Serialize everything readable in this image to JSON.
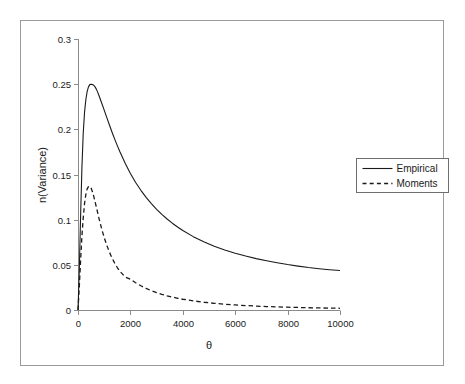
{
  "figure": {
    "border_color": "#9a9a9a",
    "background": "#ffffff",
    "plot_left_px": 78,
    "plot_right_px": 340,
    "plot_top_px": 39,
    "plot_bottom_px": 310
  },
  "chart_data": {
    "type": "line",
    "title": "",
    "subtitle": "",
    "xlabel": "θ",
    "ylabel": "n(Variance)",
    "xlim": [
      0,
      10000
    ],
    "ylim": [
      0,
      0.3
    ],
    "grid": false,
    "legend_position": "right",
    "x_ticks": [
      0,
      2000,
      4000,
      6000,
      8000,
      10000
    ],
    "x_tick_labels": [
      "0",
      "2000",
      "4000",
      "6000",
      "8000",
      "10000"
    ],
    "y_ticks": [
      0,
      0.05,
      0.1,
      0.15,
      0.2,
      0.25,
      0.3
    ],
    "y_tick_labels": [
      "0",
      "0.05",
      "0.1",
      "0.15",
      "0.2",
      "0.25",
      "0.3"
    ],
    "series": [
      {
        "name": "Empirical",
        "style": "solid",
        "color": "#1a1a1a",
        "width": 1.1,
        "x": [
          0,
          50,
          100,
          150,
          200,
          250,
          300,
          350,
          400,
          450,
          500,
          550,
          600,
          650,
          700,
          750,
          800,
          900,
          1000,
          1100,
          1200,
          1300,
          1400,
          1500,
          1600,
          1800,
          2000,
          2200,
          2400,
          2600,
          2800,
          3000,
          3200,
          3400,
          3600,
          3800,
          4000,
          4400,
          4800,
          5200,
          5600,
          6000,
          6400,
          6800,
          7200,
          7600,
          8000,
          8400,
          8800,
          9200,
          9600,
          10000
        ],
        "y": [
          0,
          0.045,
          0.105,
          0.158,
          0.196,
          0.219,
          0.233,
          0.242,
          0.247,
          0.2495,
          0.25,
          0.2497,
          0.2488,
          0.247,
          0.2445,
          0.2412,
          0.2375,
          0.2295,
          0.2212,
          0.213,
          0.2048,
          0.1968,
          0.1892,
          0.182,
          0.1752,
          0.1625,
          0.1512,
          0.1412,
          0.1325,
          0.1247,
          0.1178,
          0.1115,
          0.1058,
          0.1007,
          0.0961,
          0.0919,
          0.088,
          0.0812,
          0.0755,
          0.0706,
          0.0665,
          0.0629,
          0.0597,
          0.0569,
          0.0545,
          0.0523,
          0.0503,
          0.0486,
          0.047,
          0.0457,
          0.0446,
          0.0437
        ]
      },
      {
        "name": "Moments",
        "style": "dashed",
        "color": "#1a1a1a",
        "width": 1.3,
        "x": [
          0,
          50,
          100,
          150,
          200,
          250,
          300,
          350,
          400,
          450,
          500,
          550,
          600,
          700,
          800,
          900,
          1000,
          1100,
          1200,
          1300,
          1400,
          1500,
          1600,
          1800,
          2000,
          2200,
          2400,
          2600,
          2800,
          3000,
          3200,
          3400,
          3600,
          3800,
          4000,
          4400,
          4800,
          5200,
          5600,
          6000,
          6400,
          6800,
          7200,
          7600,
          8000,
          8400,
          8800,
          9200,
          9600,
          10000
        ],
        "y": [
          0,
          0.026,
          0.055,
          0.082,
          0.102,
          0.118,
          0.128,
          0.134,
          0.1365,
          0.137,
          0.135,
          0.131,
          0.126,
          0.114,
          0.1015,
          0.0902,
          0.0802,
          0.0715,
          0.064,
          0.0575,
          0.0519,
          0.047,
          0.0428,
          0.0366,
          0.0341,
          0.0302,
          0.0268,
          0.0239,
          0.0214,
          0.0192,
          0.0173,
          0.0157,
          0.0143,
          0.013,
          0.0119,
          0.0101,
          0.0086,
          0.0074,
          0.0064,
          0.0056,
          0.0049,
          0.0043,
          0.0038,
          0.0034,
          0.0031,
          0.0028,
          0.0025,
          0.0023,
          0.0021,
          0.0019
        ]
      }
    ]
  },
  "legend": {
    "items": [
      {
        "label": "Empirical",
        "style": "solid"
      },
      {
        "label": "Moments",
        "style": "dashed"
      }
    ]
  }
}
